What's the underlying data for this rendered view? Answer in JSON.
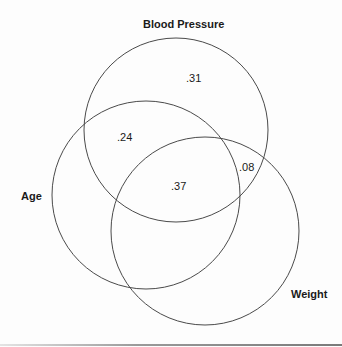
{
  "diagram": {
    "type": "venn",
    "sets": [
      {
        "id": "blood_pressure",
        "label": "Blood Pressure",
        "cx": 176,
        "cy": 130,
        "r": 92
      },
      {
        "id": "age",
        "label": "Age",
        "cx": 146,
        "cy": 195,
        "r": 94
      },
      {
        "id": "weight",
        "label": "Weight",
        "cx": 205,
        "cy": 231,
        "r": 94
      }
    ],
    "regions": [
      {
        "id": "bp_only",
        "sets": [
          "blood_pressure"
        ],
        "value": ".31"
      },
      {
        "id": "bp_age",
        "sets": [
          "blood_pressure",
          "age"
        ],
        "value": ".24"
      },
      {
        "id": "bp_age_weight",
        "sets": [
          "blood_pressure",
          "age",
          "weight"
        ],
        "value": ".37"
      },
      {
        "id": "bp_weight",
        "sets": [
          "blood_pressure",
          "weight"
        ],
        "value": ".08"
      }
    ],
    "stroke_color": "#4a4a4a",
    "text_color": "#1a1a1a"
  }
}
